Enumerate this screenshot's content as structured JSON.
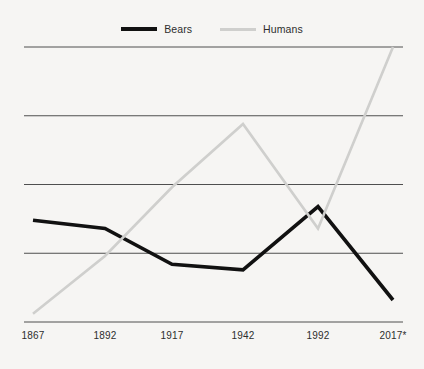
{
  "chart_data": {
    "type": "line",
    "title": "",
    "subtitle": "",
    "xlabel": "",
    "ylabel": "",
    "categories": [
      "1867",
      "1892",
      "1917",
      "1942",
      "1992",
      "2017*"
    ],
    "grid": true,
    "gridlines": 5,
    "legend_position": "top-center",
    "ylim": [
      0,
      100
    ],
    "yticks": [
      0,
      25,
      50,
      75,
      100
    ],
    "ytick_labels": [
      "",
      "",
      "",
      "",
      ""
    ],
    "series": [
      {
        "name": "Bears",
        "color": "#111111",
        "line_width": 3.6,
        "values": [
          37,
          34,
          21,
          19,
          42,
          8
        ]
      },
      {
        "name": "Humans",
        "color": "#cfcfcd",
        "line_width": 2.6,
        "values": [
          3,
          24,
          49,
          72,
          34,
          100
        ]
      }
    ],
    "annotations": [
      "2017* is a projected value"
    ]
  },
  "legend": {
    "entries": [
      {
        "label": "Bears",
        "color": "#111111"
      },
      {
        "label": "Humans",
        "color": "#cfcfcd"
      }
    ]
  },
  "axis": {
    "x_tick_labels": [
      "1867",
      "1892",
      "1917",
      "1942",
      "1992",
      "2017*"
    ]
  },
  "colors": {
    "background": "#f6f5f3",
    "gridline": "#4f4f4f",
    "bears": "#111111",
    "humans": "#cfcfcd",
    "text": "#2d2d2d"
  }
}
